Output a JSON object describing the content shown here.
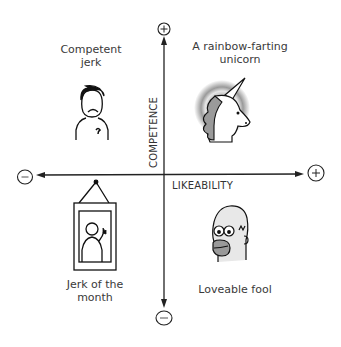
{
  "diagram": {
    "type": "quadrant",
    "axes": {
      "x": {
        "label": "LIKEABILITY",
        "min_symbol": "−",
        "max_symbol": "+"
      },
      "y": {
        "label": "COMPETENCE",
        "min_symbol": "−",
        "max_symbol": "+"
      }
    },
    "quadrants": {
      "top_left": {
        "lines": [
          "Competent",
          "jerk"
        ],
        "icon": "frowning-man-icon"
      },
      "top_right": {
        "lines": [
          "A rainbow-farting",
          "unicorn"
        ],
        "icon": "unicorn-icon"
      },
      "bottom_left": {
        "lines": [
          "Jerk of the",
          "month"
        ],
        "icon": "framed-portrait-icon"
      },
      "bottom_right": {
        "lines": [
          "Loveable fool"
        ],
        "icon": "homer-face-icon"
      }
    }
  }
}
